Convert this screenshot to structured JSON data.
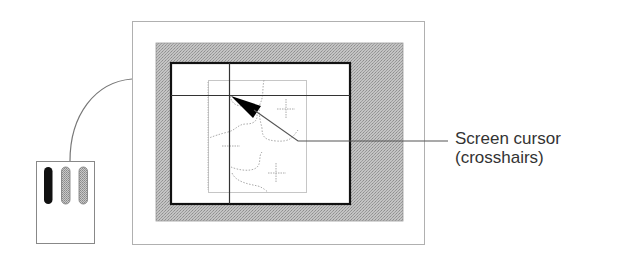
{
  "figure": {
    "type": "illustration"
  },
  "callout": {
    "line1": "Screen cursor",
    "line2": "(crosshairs)"
  },
  "puck": {
    "buttons": [
      {
        "name": "button-1",
        "state": "pressed",
        "color": "#111111"
      },
      {
        "name": "button-2",
        "state": "idle",
        "color": "#b8b8b8"
      },
      {
        "name": "button-3",
        "state": "idle",
        "color": "#b8b8b8"
      }
    ]
  },
  "colors": {
    "outline": "#999999",
    "bezel": "#b5b5b5",
    "screen_border": "#111111",
    "crosshair": "#333333",
    "map_lines": "#aaaaaa",
    "cursor": "#000000"
  }
}
